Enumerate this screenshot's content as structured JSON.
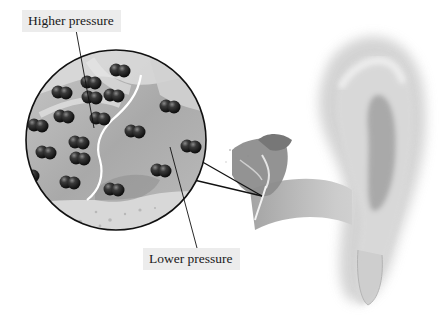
{
  "figure": {
    "labels": {
      "higher_pressure": "Higher pressure",
      "lower_pressure": "Lower pressure"
    },
    "elements": {
      "magnifier": "magnified view of ear canal with air molecules",
      "molecules": "paired dark spheres (air molecules), denser on higher-pressure side",
      "eardrum_line": "white curved membrane dividing higher and lower pressure",
      "ear": "external ear (pinna) with ear canal and middle-ear ossicles"
    },
    "colors": {
      "molecule": "#1e1e1e",
      "magnifier_bg": "#b5b5b5",
      "membrane": "#ffffff",
      "outline": "#111111",
      "label_bg": "#ececec"
    }
  }
}
